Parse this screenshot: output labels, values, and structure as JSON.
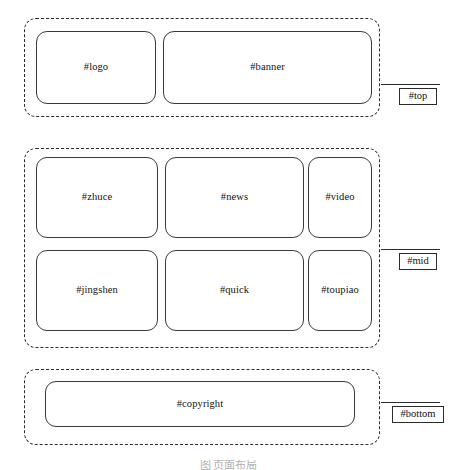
{
  "diagram": {
    "type": "page-layout-wireframe",
    "background_color": "#ffffff",
    "line_color": "#2b2b2b",
    "box_border_color": "#3a3a3a",
    "caption": "图  页面布局"
  },
  "sections": [
    {
      "id": "top",
      "label": "#top",
      "boxes": [
        {
          "id": "logo",
          "label": "#logo"
        },
        {
          "id": "banner",
          "label": "#banner"
        }
      ]
    },
    {
      "id": "mid",
      "label": "#mid",
      "boxes": [
        {
          "id": "zhuce",
          "label": "#zhuce"
        },
        {
          "id": "news",
          "label": "#news"
        },
        {
          "id": "video",
          "label": "#video"
        },
        {
          "id": "jingshen",
          "label": "#jingshen"
        },
        {
          "id": "quick",
          "label": "#quick"
        },
        {
          "id": "toupiao",
          "label": "#toupiao"
        }
      ]
    },
    {
      "id": "bottom",
      "label": "#bottom",
      "boxes": [
        {
          "id": "copyright",
          "label": "#copyright"
        }
      ]
    }
  ]
}
